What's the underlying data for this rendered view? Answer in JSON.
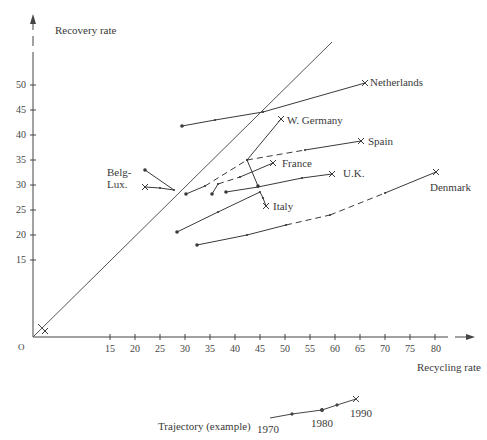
{
  "chart_data": {
    "type": "line",
    "title": "",
    "xlabel": "Recycling rate",
    "ylabel": "Recovery rate",
    "origin_label": "O",
    "x_ticks": [
      15,
      20,
      25,
      30,
      35,
      40,
      45,
      50,
      55,
      60,
      65,
      70,
      75,
      80
    ],
    "y_ticks": [
      15,
      20,
      25,
      30,
      35,
      40,
      45,
      50
    ],
    "xlim": [
      0,
      85
    ],
    "ylim": [
      0,
      58
    ],
    "grid": false,
    "reference_line": {
      "name": "recovery = recycling diagonal",
      "from": [
        0,
        0
      ],
      "to": [
        59.4,
        58.6
      ]
    },
    "series": [
      {
        "name": "Netherlands",
        "label_pos": [
          67.5,
          50.8
        ],
        "points": [
          [
            29.4,
            41.8
          ],
          [
            36.0,
            43.0
          ],
          [
            45.6,
            44.6
          ],
          [
            66.0,
            50.4
          ]
        ],
        "dashed_segments": []
      },
      {
        "name": "W. Germany",
        "label_pos": [
          50.5,
          43.2
        ],
        "points": [
          [
            44.6,
            29.8
          ],
          [
            42.4,
            35.0
          ],
          [
            49.2,
            43.2
          ]
        ],
        "dashed_segments": []
      },
      {
        "name": "Spain",
        "label_pos": [
          67.0,
          39.0
        ],
        "points": [
          [
            30.2,
            28.2
          ],
          [
            34.0,
            29.8
          ],
          [
            42.4,
            35.0
          ],
          [
            54.0,
            37.0
          ],
          [
            65.2,
            38.8
          ]
        ],
        "dashed_segments": [
          1,
          2
        ]
      },
      {
        "name": "France",
        "label_pos": [
          49.5,
          35.0
        ],
        "points": [
          [
            35.4,
            28.2
          ],
          [
            36.6,
            30.2
          ],
          [
            41.0,
            31.6
          ],
          [
            47.6,
            34.4
          ]
        ],
        "dashed_segments": [
          1
        ]
      },
      {
        "name": "U.K.",
        "label_pos": [
          62.0,
          32.8
        ],
        "points": [
          [
            38.2,
            28.6
          ],
          [
            44.6,
            29.6
          ],
          [
            53.4,
            31.4
          ],
          [
            59.4,
            32.2
          ]
        ],
        "dashed_segments": []
      },
      {
        "name": "Italy",
        "label_pos": [
          48.0,
          26.5
        ],
        "points": [
          [
            28.4,
            20.6
          ],
          [
            36.6,
            24.6
          ],
          [
            45.0,
            28.6
          ],
          [
            45.6,
            27.4
          ],
          [
            46.2,
            25.8
          ]
        ],
        "dashed_segments": []
      },
      {
        "name": "Denmark",
        "label_pos": [
          76.0,
          29.8
        ],
        "points": [
          [
            32.4,
            18.0
          ],
          [
            42.4,
            20.0
          ],
          [
            50.2,
            22.0
          ],
          [
            59.0,
            24.0
          ],
          [
            70.0,
            28.4
          ],
          [
            80.2,
            32.6
          ]
        ],
        "dashed_segments": [
          2,
          3
        ]
      },
      {
        "name": "Belg-Lux.",
        "label_pos": [
          15.0,
          33.6
        ],
        "points": [
          [
            22.0,
            33.0
          ],
          [
            27.8,
            29.0
          ],
          [
            25.0,
            29.4
          ],
          [
            22.0,
            29.6
          ]
        ],
        "dashed_segments": []
      },
      {
        "name": "origin-cluster",
        "label_pos": null,
        "points": [
          [
            0.6,
            2.2
          ],
          [
            2.0,
            0.8
          ]
        ],
        "dashed_segments": []
      }
    ],
    "legend": {
      "label": "Trajectory (example)",
      "years": [
        "1970",
        "1980",
        "1990"
      ]
    }
  },
  "axes": {
    "y_label": "Recovery rate",
    "x_label": "Recycling rate",
    "origin": "O"
  },
  "labels": {
    "netherlands": "Netherlands",
    "w_germany": "W. Germany",
    "spain": "Spain",
    "france": "France",
    "uk": "U.K.",
    "italy": "Italy",
    "denmark": "Denmark",
    "belg_1": "Belg-",
    "belg_2": "Lux."
  },
  "legend": {
    "label": "Trajectory (example)",
    "year_1970": "1970",
    "year_1980": "1980",
    "year_1990": "1990"
  },
  "ticks": {
    "x": [
      "15",
      "20",
      "25",
      "30",
      "35",
      "40",
      "45",
      "50",
      "55",
      "60",
      "65",
      "70",
      "75",
      "80"
    ],
    "y": [
      "50",
      "45",
      "40",
      "35",
      "30",
      "25",
      "20",
      "15"
    ]
  },
  "colors": {
    "ink": "#3a3a3a",
    "background": "#ffffff"
  }
}
